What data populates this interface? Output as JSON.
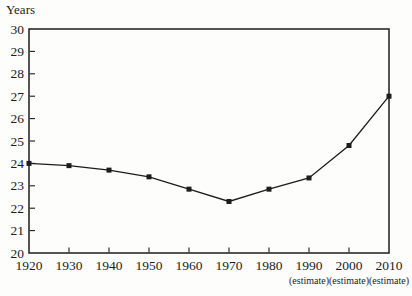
{
  "figure": {
    "background": "#fdfdfc",
    "ink": "#1c1c1c"
  },
  "chart_data": {
    "type": "line",
    "title": "",
    "ylabel": "Years",
    "xlabel": "",
    "categories": [
      "1920",
      "1930",
      "1940",
      "1950",
      "1960",
      "1970",
      "1980",
      "1990",
      "2000",
      "2010"
    ],
    "values": [
      24.0,
      23.9,
      23.7,
      23.4,
      22.85,
      22.3,
      22.85,
      23.35,
      24.8,
      27.0
    ],
    "ylim": [
      20,
      30
    ],
    "ytick_step": 1,
    "yticks": [
      20,
      21,
      22,
      23,
      24,
      25,
      26,
      27,
      28,
      29,
      30
    ],
    "estimate_note": "(estimate)",
    "estimate_categories": [
      "1990",
      "2000",
      "2010"
    ],
    "line_color": "#1c1c1c",
    "marker": "filled-square",
    "grid": false,
    "legend": "none",
    "plot_border": "box"
  }
}
